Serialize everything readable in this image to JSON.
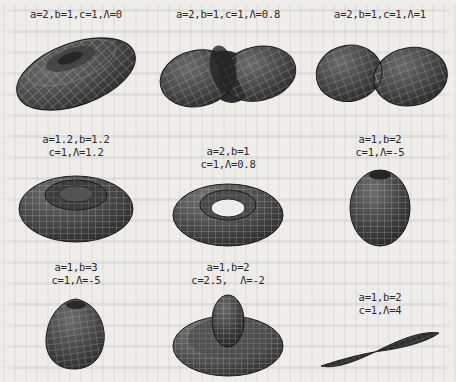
{
  "figure": {
    "type": "surface-plot-grid",
    "rows": 3,
    "columns": 3,
    "background_color": "#eeedea",
    "mesh_color": "#3a3a3a",
    "text_color": "#2a2a2a"
  },
  "panels": [
    {
      "id": "panel-1",
      "shape": "ellipsoid",
      "caption_lines": [
        "a=2,b=1,c=1,Λ=0"
      ],
      "params": {
        "a": 2,
        "b": 1,
        "c": 1,
        "Lambda": 0
      }
    },
    {
      "id": "panel-2",
      "shape": "peanut-bilobe",
      "caption_lines": [
        "a=2,b=1,c=1,Λ=0.8"
      ],
      "params": {
        "a": 2,
        "b": 1,
        "c": 1,
        "Lambda": 0.8
      }
    },
    {
      "id": "panel-3",
      "shape": "two-touching-lobes",
      "caption_lines": [
        "a=2,b=1,c=1,Λ=1"
      ],
      "params": {
        "a": 2,
        "b": 1,
        "c": 1,
        "Lambda": 1
      }
    },
    {
      "id": "panel-4",
      "shape": "dimpled-torus",
      "caption_lines": [
        "a=1.2,b=1.2",
        "c=1,Λ=1.2"
      ],
      "params": {
        "a": 1.2,
        "b": 1.2,
        "c": 1,
        "Lambda": 1.2
      }
    },
    {
      "id": "panel-5",
      "shape": "torus",
      "caption_lines": [
        "a=2,b=1",
        "c=1,Λ=0.8"
      ],
      "params": {
        "a": 2,
        "b": 1,
        "c": 1,
        "Lambda": 0.8
      }
    },
    {
      "id": "panel-6",
      "shape": "prolate-sphere",
      "caption_lines": [
        "a=1,b=2",
        "c=1,Λ=-5"
      ],
      "params": {
        "a": 1,
        "b": 2,
        "c": 1,
        "Lambda": -5
      }
    },
    {
      "id": "panel-7",
      "shape": "teardrop-blob",
      "caption_lines": [
        "a=1,b=3",
        "c=1,Λ=-5"
      ],
      "params": {
        "a": 1,
        "b": 3,
        "c": 1,
        "Lambda": -5
      }
    },
    {
      "id": "panel-8",
      "shape": "disc-with-central-bulb",
      "caption_lines": [
        "a=1,b=2",
        "c=2.5,  Λ=-2"
      ],
      "params": {
        "a": 1,
        "b": 2,
        "c": 2.5,
        "Lambda": -2
      }
    },
    {
      "id": "panel-9",
      "shape": "thin-bowtie-spindle",
      "caption_lines": [
        "a=1,b=2",
        "c=1,Λ=4"
      ],
      "params": {
        "a": 1,
        "b": 2,
        "c": 1,
        "Lambda": 4
      }
    }
  ]
}
